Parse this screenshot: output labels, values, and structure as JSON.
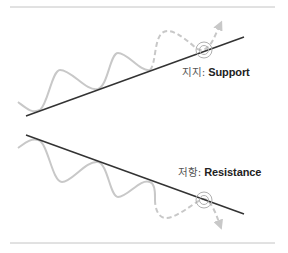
{
  "support": {
    "label_ko": "지지:",
    "label_en": "Support"
  },
  "resistance": {
    "label_ko": "저항:",
    "label_en": "Resistance"
  },
  "colors": {
    "trend_line": "#333333",
    "price_wave": "#c8c8c8",
    "divider": "#c4c4c4",
    "circle": "#b0b0b0"
  }
}
